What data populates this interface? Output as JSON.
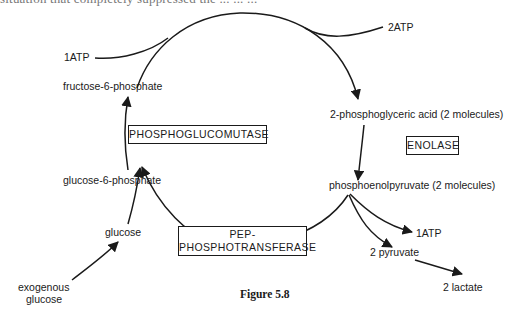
{
  "page": {
    "cutoff_text": "situation that completely suppressed the ... ... ..."
  },
  "diagram": {
    "nodes": {
      "atp_in": "1ATP",
      "atp_out": "2ATP",
      "fructose_6_phosphate": "fructose-6-phosphate",
      "phosphoglyceric_acid": "2-phosphoglyceric acid (2 molecules)",
      "phosphoenolpyruvate": "phosphoenolpyruvate (2 molecules)",
      "glucose_6_phosphate": "glucose-6-phosphate",
      "glucose": "glucose",
      "exogenous_glucose_line1": "exogenous",
      "exogenous_glucose_line2": "glucose",
      "atp_yield": "1ATP",
      "pyruvate": "2 pyruvate",
      "lactate": "2 lactate"
    },
    "enzymes": {
      "phosphoglucomutase": "PHOSPHOGLUCOMUTASE",
      "enolase": "ENOLASE",
      "pep_line1": "PEP-",
      "pep_line2": "PHOSPHOTRANSFERASE"
    },
    "caption": "Figure 5.8",
    "colors": {
      "ink": "#1a1a1a",
      "background": "#ffffff"
    }
  }
}
